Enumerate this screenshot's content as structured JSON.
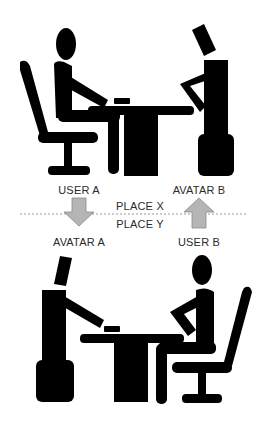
{
  "diagram": {
    "top_scene": {
      "left": "USER A",
      "right": "AVATAR B"
    },
    "divider": {
      "above": "PLACE X",
      "below": "PLACE Y"
    },
    "bottom_scene": {
      "left": "AVATAR A",
      "right": "USER B"
    },
    "arrows": [
      {
        "from": "USER A",
        "to": "AVATAR A",
        "direction": "down"
      },
      {
        "from": "USER B",
        "to": "AVATAR B",
        "direction": "up"
      }
    ],
    "colors": {
      "figure": "#000000",
      "arrow": "#b5b5b5",
      "arrow_stroke": "#8a8a8a",
      "divider": "#999999"
    }
  }
}
